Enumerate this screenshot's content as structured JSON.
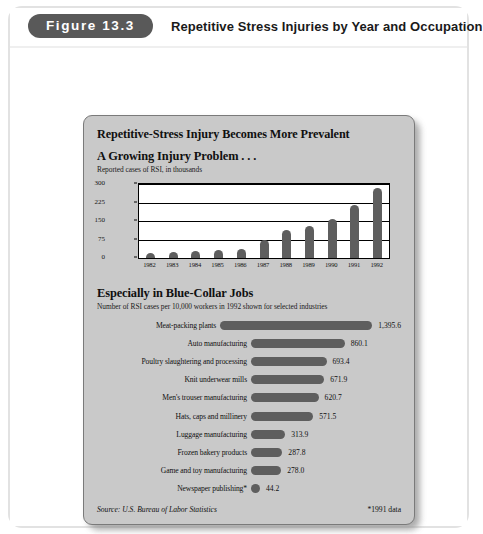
{
  "header": {
    "figure_badge": "Figure 13.3",
    "title": "Repetitive Stress Injuries by Year and Occupation"
  },
  "card": {
    "title": "Repetitive-Stress Injury Becomes More Prevalent",
    "source": "Source: U.S. Bureau of Labor Statistics",
    "footnote": "*1991 data"
  },
  "section_top": {
    "heading": "A Growing Injury Problem . . .",
    "subheading": "Reported cases of RSI, in thousands"
  },
  "section_bottom": {
    "heading": "Especially in Blue-Collar Jobs",
    "subheading": "Number of RSI cases per 10,000 workers in 1992 shown for selected industries"
  },
  "colors": {
    "bar": "#5e5e5e",
    "card_background": "#c9c9c9",
    "badge": "#595959",
    "plot_background": "#ffffff"
  },
  "chart_data": [
    {
      "type": "bar",
      "title": "A Growing Injury Problem . . .",
      "subtitle": "Reported cases of RSI, in thousands",
      "xlabel": "",
      "ylabel": "Reported cases of RSI, in thousands",
      "categories": [
        "1982",
        "1983",
        "1984",
        "1985",
        "1986",
        "1987",
        "1988",
        "1989",
        "1990",
        "1991",
        "1992"
      ],
      "values": [
        22,
        24,
        27,
        32,
        38,
        73,
        115,
        130,
        160,
        215,
        282
      ],
      "yticks": [
        0,
        75,
        150,
        225,
        300
      ],
      "ylim": [
        0,
        300
      ],
      "grid": true,
      "legend": false
    },
    {
      "type": "bar",
      "orientation": "horizontal",
      "title": "Especially in Blue-Collar Jobs",
      "subtitle": "Number of RSI cases per 10,000 workers in 1992 shown for selected industries",
      "xlabel": "RSI cases per 10,000 workers",
      "ylabel": "",
      "categories": [
        "Meat-packing plants",
        "Auto manufacturing",
        "Poultry slaughtering and processing",
        "Knit underwear mills",
        "Men's trouser manufacturing",
        "Hats, caps and millinery",
        "Luggage manufacturing",
        "Frozen bakery products",
        "Game and toy manufacturing",
        "Newspaper publishing*"
      ],
      "values": [
        1395.6,
        860.1,
        693.4,
        671.9,
        620.7,
        571.5,
        313.9,
        287.8,
        278.0,
        44.2
      ],
      "value_labels": [
        "1,395.6",
        "860.1",
        "693.4",
        "671.9",
        "620.7",
        "571.5",
        "313.9",
        "287.8",
        "278.0",
        "44.2"
      ],
      "xlim": [
        0,
        1395.6
      ],
      "grid": false,
      "legend": false,
      "note": "*1991 data"
    }
  ]
}
